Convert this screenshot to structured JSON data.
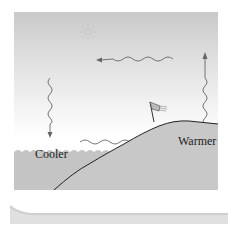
{
  "diagram": {
    "labels": {
      "cool_side": "Cooler",
      "warm_side": "Warmer"
    },
    "elements": {
      "sun": "sun-icon",
      "flag": "windsock-flag-icon",
      "arrows": [
        {
          "name": "upper-return-flow-arrow",
          "direction": "left"
        },
        {
          "name": "sinking-air-arrow",
          "direction": "down"
        },
        {
          "name": "surface-sea-breeze-arrow",
          "direction": "right"
        },
        {
          "name": "rising-air-arrow",
          "direction": "up"
        }
      ]
    },
    "colors": {
      "sky_top": "#c9c9c9",
      "sky_bottom": "#ffffff",
      "water": "#c4c4c4",
      "land": "#c8c8c8",
      "arrow": "#666666",
      "coastline": "#222222"
    }
  }
}
